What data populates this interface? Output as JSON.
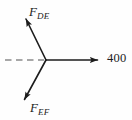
{
  "diagram": {
    "kind": "force-vector-diagram",
    "background_color": "#fefefe",
    "stroke_color": "#1c1c1c",
    "dashed_color": "#8a8a8a",
    "origin": {
      "x": 46,
      "y": 60
    },
    "vectors": [
      {
        "id": "f-de",
        "label_symbol": "F",
        "label_subscript": "DE",
        "label_text": "F_DE",
        "direction": "up-left",
        "tip": {
          "x": 23,
          "y": 13
        },
        "arrowhead": "solid-triangle"
      },
      {
        "id": "f-ef",
        "label_symbol": "F",
        "label_subscript": "EF",
        "label_text": "F_EF",
        "direction": "down-left",
        "tip": {
          "x": 21,
          "y": 104
        },
        "arrowhead": "solid-triangle"
      },
      {
        "id": "resultant",
        "label_symbol": "400",
        "label_subscript": "",
        "label_text": "400",
        "direction": "right",
        "tip": {
          "x": 103,
          "y": 60
        },
        "arrowhead": "solid-triangle"
      }
    ],
    "reference_line": {
      "id": "horizontal-axis",
      "style": "dashed",
      "from": {
        "x": 5,
        "y": 60
      },
      "to": {
        "x": 44,
        "y": 60
      }
    }
  },
  "labels": {
    "f_de": {
      "symbol": "F",
      "subscript": "DE"
    },
    "f_ef": {
      "symbol": "F",
      "subscript": "EF"
    },
    "magnitude": "400"
  }
}
